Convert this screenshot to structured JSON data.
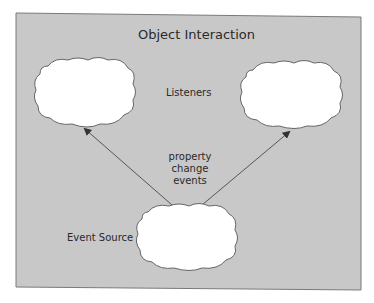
{
  "diagram": {
    "title": "Object Interaction",
    "listeners_label": "Listeners",
    "edge_label": [
      "property",
      "change",
      "events"
    ],
    "source_label": "Event Source",
    "nodes": [
      {
        "id": "listener-left",
        "role": "listener"
      },
      {
        "id": "listener-right",
        "role": "listener"
      },
      {
        "id": "event-source",
        "role": "source"
      }
    ],
    "edges": [
      {
        "from": "event-source",
        "to": "listener-left"
      },
      {
        "from": "event-source",
        "to": "listener-right"
      }
    ],
    "colors": {
      "background": "#c8c8c8",
      "border": "#7a7a7a",
      "cloud_fill": "#ffffff",
      "cloud_stroke": "#666666",
      "arrow": "#555555",
      "text": "#2a2a2a"
    }
  }
}
